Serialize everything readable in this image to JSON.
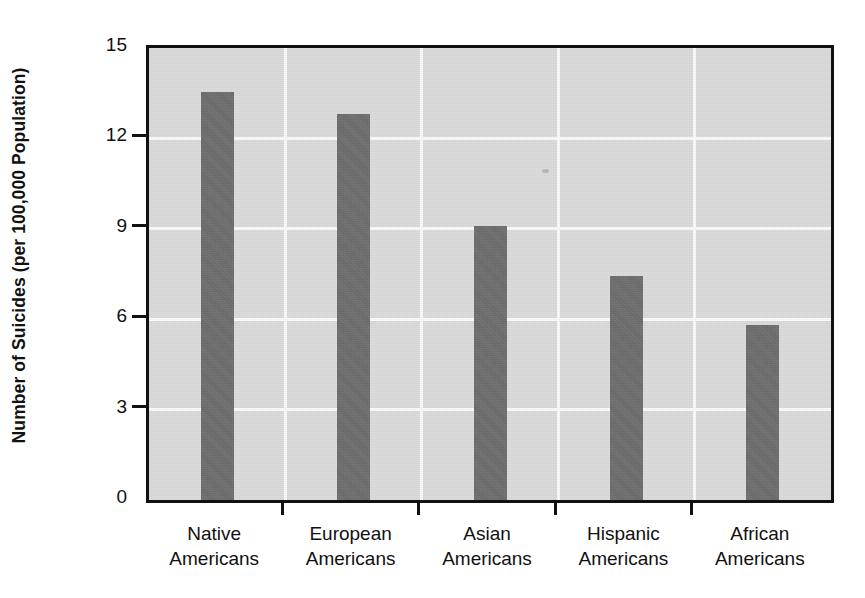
{
  "chart_data": {
    "type": "bar",
    "title": "",
    "xlabel": "",
    "ylabel": "Number of Suicides (per 100,000 Population)",
    "categories": [
      "Native Americans",
      "European Americans",
      "Asian Americans",
      "Hispanic Americans",
      "African Americans"
    ],
    "category_lines": [
      [
        "Native",
        "Americans"
      ],
      [
        "European",
        "Americans"
      ],
      [
        "Asian",
        "Americans"
      ],
      [
        "Hispanic",
        "Americans"
      ],
      [
        "African",
        "Americans"
      ]
    ],
    "values": [
      13.55,
      12.8,
      9.1,
      7.45,
      5.8
    ],
    "ylim": [
      0,
      15
    ],
    "yticks": [
      0,
      3,
      6,
      9,
      12,
      15
    ],
    "ytick_labels": [
      "0",
      "3",
      "6",
      "9",
      "12",
      "15"
    ],
    "grid": "white gridlines on gray panel, horizontal at yticks and vertical between categories",
    "legend": "none",
    "bar_color": "#6e6e6e",
    "panel_color": "#dcdcdc",
    "gridline_color": "#fbfbfb",
    "axis_color": "#111111"
  }
}
